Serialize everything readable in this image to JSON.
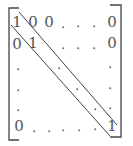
{
  "matrix": {
    "description": "Identity matrix in bracket notation with diagonal band lines",
    "row1": {
      "c1": "1",
      "c2": "0",
      "c3": "0",
      "last": "0"
    },
    "row2": {
      "c1": "0",
      "c2": "1",
      "last": "0"
    },
    "row6": {
      "c1": "0",
      "last": "1"
    },
    "colors": {
      "text": "#555555",
      "lines": "#444444",
      "dots": "#777777"
    }
  }
}
